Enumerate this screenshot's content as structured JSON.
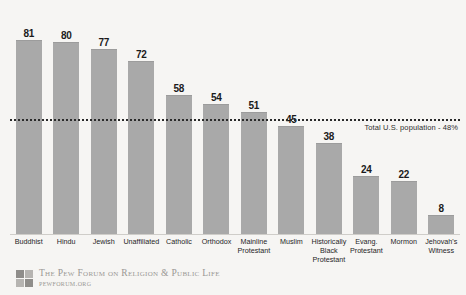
{
  "chart_data": {
    "type": "bar",
    "title": "",
    "xlabel": "",
    "ylabel": "",
    "ylim": [
      0,
      90
    ],
    "grid": false,
    "legend": "none",
    "categories": [
      "Buddhist",
      "Hindu",
      "Jewish",
      "Unaffiliated",
      "Catholic",
      "Orthodox",
      "Mainline Protestant",
      "Muslim",
      "Historically Black Protestant",
      "Evang. Protestant",
      "Mormon",
      "Jehovah's Witness"
    ],
    "values": [
      81,
      80,
      77,
      72,
      58,
      54,
      51,
      45,
      38,
      24,
      22,
      8
    ],
    "bar_color": "#a9a9a9",
    "reference_line": {
      "value": 48,
      "label": "Total U.S. population - 48%",
      "style": "dotted",
      "color": "#2a2a2a"
    }
  },
  "categories_display": [
    [
      "Buddhist"
    ],
    [
      "Hindu"
    ],
    [
      "Jewish"
    ],
    [
      "Unaffiliated"
    ],
    [
      "Catholic"
    ],
    [
      "Orthodox"
    ],
    [
      "Mainline",
      "Protestant"
    ],
    [
      "Muslim"
    ],
    [
      "Historically",
      "Black",
      "Protestant"
    ],
    [
      "Evang.",
      "Protestant"
    ],
    [
      "Mormon"
    ],
    [
      "Jehovah's",
      "Witness"
    ]
  ],
  "footer": {
    "organization": "The Pew Forum on Religion & Public Life",
    "website": "pewforum.org"
  }
}
